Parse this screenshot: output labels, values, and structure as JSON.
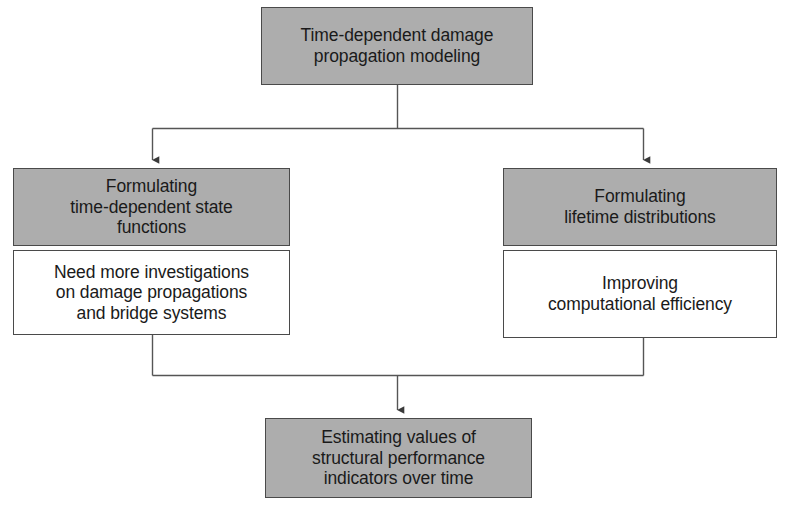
{
  "diagram": {
    "canvas": {
      "width": 789,
      "height": 513,
      "background": "#ffffff"
    },
    "colors": {
      "box_gray_fill": "#adadad",
      "box_white_fill": "#ffffff",
      "box_border": "#4a4a4a",
      "connector_line": "#555555",
      "text": "#1a1a1a"
    },
    "nodes": {
      "root": {
        "label": "Time-dependent damage\npropagation modeling",
        "fill": "gray",
        "x": 261,
        "y": 7,
        "width": 272,
        "height": 78
      },
      "branch_left_header": {
        "label": "Formulating\ntime-dependent state\nfunctions",
        "fill": "gray",
        "x": 13,
        "y": 168,
        "width": 277,
        "height": 78
      },
      "branch_left_body": {
        "label": "Need more investigations\non damage propagations\nand bridge systems",
        "fill": "white",
        "x": 13,
        "y": 250,
        "width": 277,
        "height": 85
      },
      "branch_right_header": {
        "label": "Formulating\nlifetime distributions",
        "fill": "gray",
        "x": 503,
        "y": 168,
        "width": 274,
        "height": 78
      },
      "branch_right_body": {
        "label": "Improving\ncomputational efficiency",
        "fill": "white",
        "x": 503,
        "y": 250,
        "width": 274,
        "height": 88
      },
      "outcome": {
        "label": "Estimating values of\nstructural performance\nindicators over time",
        "fill": "gray",
        "x": 265,
        "y": 418,
        "width": 267,
        "height": 80
      }
    },
    "connectors": {
      "fork": {
        "name": "root-to-branches",
        "stem_x": 397,
        "stem_from_y": 85,
        "stem_to_y": 128,
        "bar_y": 128,
        "bar_from_x": 152,
        "bar_to_x": 643,
        "left_drop_x": 152,
        "right_drop_x": 643,
        "drop_to_y": 168
      },
      "merge": {
        "name": "branches-to-outcome",
        "left_riser_x": 152,
        "left_from_y": 335,
        "right_riser_x": 643,
        "right_from_y": 338,
        "bar_y": 375,
        "bar_from_x": 152,
        "bar_to_x": 643,
        "stem_x": 397,
        "stem_to_y": 418
      }
    }
  }
}
